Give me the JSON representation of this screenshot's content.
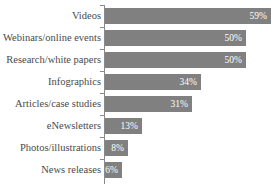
{
  "chart_data": {
    "type": "bar",
    "orientation": "horizontal",
    "title": "",
    "xlabel": "",
    "ylabel": "",
    "xlim": [
      0,
      61
    ],
    "grid": false,
    "legend": null,
    "bar_color": "#808080",
    "value_label_color": "#ffffff",
    "axis_color": "#8a8a8a",
    "categories": [
      "Videos",
      "Webinars/online events",
      "Research/white papers",
      "Infographics",
      "Articles/case studies",
      "eNewsletters",
      "Photos/illustrations",
      "News releases"
    ],
    "values": [
      59,
      50,
      50,
      34,
      31,
      13,
      8,
      6
    ],
    "value_labels": [
      "59%",
      "50%",
      "50%",
      "34%",
      "31%",
      "13%",
      "8%",
      "6%"
    ]
  },
  "rows": [
    {
      "label": "Videos",
      "value": 59,
      "value_label": "59%"
    },
    {
      "label": "Webinars/online events",
      "value": 50,
      "value_label": "50%"
    },
    {
      "label": "Research/white papers",
      "value": 50,
      "value_label": "50%"
    },
    {
      "label": "Infographics",
      "value": 34,
      "value_label": "34%"
    },
    {
      "label": "Articles/case studies",
      "value": 31,
      "value_label": "31%"
    },
    {
      "label": "eNewsletters",
      "value": 13,
      "value_label": "13%"
    },
    {
      "label": "Photos/illustrations",
      "value": 8,
      "value_label": "8%"
    },
    {
      "label": "News releases",
      "value": 6,
      "value_label": "6%"
    }
  ],
  "title_sliver": ""
}
